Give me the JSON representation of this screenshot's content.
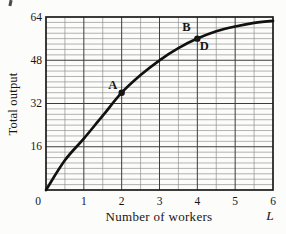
{
  "figure_background": "#fcfcfa",
  "colors": {
    "ink": "#161616",
    "frame": "#1a1a1a",
    "major_grid": "#3d3d3d",
    "minor_grid": "#8a8a8a",
    "curve": "#111111"
  },
  "chart_data": {
    "type": "line",
    "title": "",
    "xlabel": "Number of workers",
    "xlabel_symbol": "L",
    "ylabel": "Total output",
    "xlim": [
      0,
      6
    ],
    "ylim": [
      0,
      64
    ],
    "x_ticks": [
      0,
      1,
      2,
      3,
      4,
      5,
      6
    ],
    "y_ticks": [
      16,
      32,
      48,
      64
    ],
    "x_minor_step": 0.5,
    "y_minor_step": 2,
    "grid": "on",
    "legend": "none",
    "series": [
      {
        "name": "total-product-curve",
        "x": [
          0,
          0.5,
          1,
          1.5,
          2,
          2.5,
          3,
          3.5,
          4,
          4.5,
          5,
          5.5,
          6
        ],
        "y": [
          0,
          11,
          19,
          27.5,
          36,
          42.5,
          48,
          52.5,
          56,
          58.7,
          60.5,
          61.8,
          62.6
        ]
      }
    ],
    "points": [
      {
        "label": "A",
        "x": 2,
        "y": 36,
        "dot": true,
        "label_dx": -9,
        "label_dy": -4
      },
      {
        "label": "B",
        "x": 4,
        "y": 56,
        "dot": true,
        "label_dx": -11,
        "label_dy": -8
      },
      {
        "label": "D",
        "x": 4,
        "y": 56,
        "dot": false,
        "label_dx": 7,
        "label_dy": 11
      }
    ]
  }
}
